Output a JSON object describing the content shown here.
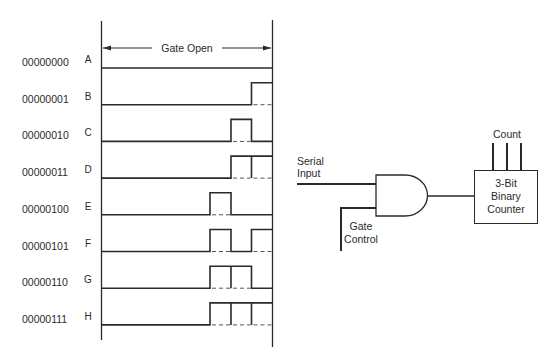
{
  "figure": {
    "gate_open_label": "Gate Open",
    "rows": [
      {
        "code": "00000000",
        "letter": "A",
        "bits": [
          0,
          0,
          0
        ]
      },
      {
        "code": "00000001",
        "letter": "B",
        "bits": [
          0,
          0,
          1
        ]
      },
      {
        "code": "00000010",
        "letter": "C",
        "bits": [
          0,
          1,
          0
        ]
      },
      {
        "code": "00000011",
        "letter": "D",
        "bits": [
          0,
          1,
          1
        ]
      },
      {
        "code": "00000100",
        "letter": "E",
        "bits": [
          1,
          0,
          0
        ]
      },
      {
        "code": "00000101",
        "letter": "F",
        "bits": [
          1,
          0,
          1
        ]
      },
      {
        "code": "00000110",
        "letter": "G",
        "bits": [
          1,
          1,
          0
        ]
      },
      {
        "code": "00000111",
        "letter": "H",
        "bits": [
          1,
          1,
          1
        ]
      }
    ],
    "circuit": {
      "serial_input_line1": "Serial",
      "serial_input_line2": "Input",
      "gate_control_line1": "Gate",
      "gate_control_line2": "Control",
      "counter_line1": "3-Bit",
      "counter_line2": "Binary",
      "counter_line3": "Counter",
      "count_label": "Count"
    }
  },
  "colors": {
    "ink": "#2a2a2a",
    "background": "#ffffff"
  }
}
